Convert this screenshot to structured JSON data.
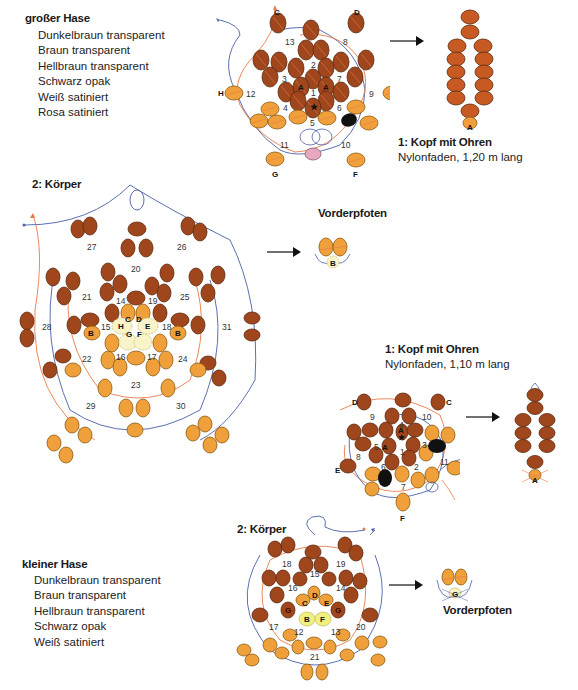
{
  "large_rabbit": {
    "title": "großer Hase",
    "materials": [
      "Dunkelbraun transparent",
      "Braun transparent",
      "Hellbraun transparent",
      "Schwarz opak",
      "Weiß satiniert",
      "Rosa satiniert"
    ],
    "step1": {
      "title": "1: Kopf mit Ohren",
      "thread": "Nylonfaden, 1,20 m lang"
    },
    "step2": {
      "title": "2: Körper"
    },
    "paws": {
      "title": "Vorderpfoten"
    },
    "head_numbers": [
      "1",
      "2",
      "3",
      "4",
      "5",
      "6",
      "7",
      "8",
      "9",
      "10",
      "11",
      "12",
      "13"
    ],
    "head_letters": [
      "A",
      "A",
      "C",
      "D",
      "E",
      "F",
      "G",
      "H"
    ],
    "body_numbers": [
      "14",
      "15",
      "16",
      "17",
      "18",
      "19",
      "20",
      "21",
      "22",
      "23",
      "24",
      "25",
      "26",
      "27",
      "28",
      "29",
      "30",
      "31"
    ],
    "body_letters": [
      "C",
      "D",
      "H",
      "E",
      "G",
      "F",
      "B",
      "B"
    ],
    "ear_label": "A",
    "paw_label": "B"
  },
  "small_rabbit": {
    "title": "kleiner Hase",
    "materials": [
      "Dunkelbraun transparent",
      "Braun transparent",
      "Hellbraun transparent",
      "Schwarz opak",
      "Weiß satiniert"
    ],
    "step1": {
      "title": "1: Kopf mit Ohren",
      "thread": "Nylonfaden, 1,10 m lang"
    },
    "step2": {
      "title": "2: Körper"
    },
    "paws": {
      "title": "Vorderpfoten"
    },
    "head_numbers": [
      "1",
      "2",
      "3",
      "4",
      "5",
      "6",
      "7",
      "8",
      "9",
      "10",
      "11"
    ],
    "head_letters": [
      "A",
      "A",
      "B",
      "C",
      "D",
      "E",
      "F"
    ],
    "body_numbers": [
      "12",
      "13",
      "14",
      "15",
      "16",
      "17",
      "18",
      "19",
      "20",
      "21"
    ],
    "body_letters": [
      "C",
      "D",
      "E",
      "B",
      "F",
      "G",
      "G"
    ],
    "ear_label": "A",
    "paw_label": "G"
  },
  "colors": {
    "dark_brown": "#a0461c",
    "brown": "#c65a22",
    "light_brown": "#f0a03a",
    "black": "#111111",
    "white": "#f8f3c8",
    "pink": "#e8a8c0",
    "thread_orange": "#e87a4a",
    "thread_blue": "#4a5fa8",
    "bead_stroke": "#5a2a10"
  }
}
